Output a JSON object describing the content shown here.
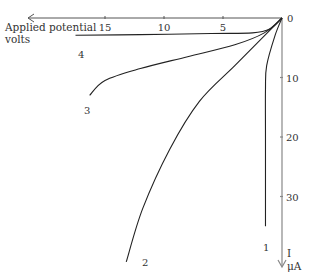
{
  "figure": {
    "x_axis_label_line1": "Applied potential",
    "x_axis_label_line2": "volts",
    "y_axis_label_line1": "I",
    "y_axis_label_line2": "μA",
    "origin_label": "0",
    "x_ticks": [
      "15",
      "10",
      "5"
    ],
    "y_ticks": [
      "10",
      "20",
      "30"
    ],
    "curve_labels": [
      "1",
      "2",
      "3",
      "4"
    ]
  },
  "chart_data": {
    "type": "line",
    "title": "",
    "xlabel": "Applied potential volts",
    "ylabel": "I μA",
    "x_direction": "increasing-left",
    "y_direction": "increasing-down",
    "xlim": [
      0,
      19
    ],
    "ylim": [
      0,
      41
    ],
    "x_tick_values": [
      15,
      10,
      5
    ],
    "y_tick_values": [
      10,
      20,
      30
    ],
    "series": [
      {
        "name": "1",
        "points": [
          [
            0,
            0
          ],
          [
            0.6,
            3
          ],
          [
            1.3,
            8
          ],
          [
            1.4,
            12
          ],
          [
            1.4,
            20
          ],
          [
            1.4,
            35
          ]
        ]
      },
      {
        "name": "2",
        "points": [
          [
            0,
            0
          ],
          [
            1.5,
            3
          ],
          [
            4,
            8
          ],
          [
            7,
            14
          ],
          [
            9.5,
            22
          ],
          [
            11.8,
            32
          ],
          [
            13.2,
            41
          ]
        ]
      },
      {
        "name": "3",
        "points": [
          [
            0,
            0
          ],
          [
            1.5,
            2.5
          ],
          [
            4,
            4.5
          ],
          [
            8,
            6.5
          ],
          [
            12,
            8.5
          ],
          [
            15,
            10.5
          ],
          [
            16.3,
            13
          ]
        ]
      },
      {
        "name": "4",
        "points": [
          [
            0,
            0
          ],
          [
            1,
            1.8
          ],
          [
            2.5,
            2.5
          ],
          [
            6,
            2.6
          ],
          [
            12,
            2.8
          ],
          [
            17.5,
            2.9
          ]
        ]
      }
    ]
  }
}
